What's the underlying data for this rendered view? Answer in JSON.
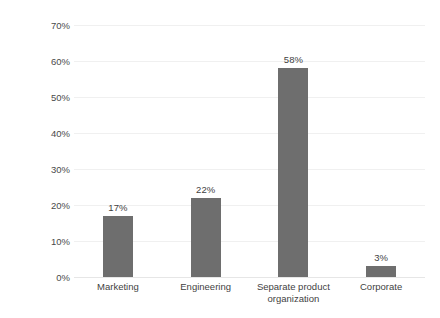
{
  "chart_data": {
    "type": "bar",
    "title": "",
    "subtitle": "",
    "xlabel": "",
    "ylabel": "Percentage",
    "categories": [
      "Marketing",
      "Engineering",
      "Separate product organization",
      "Corporate"
    ],
    "category_label_lines": [
      [
        "Marketing"
      ],
      [
        "Engineering"
      ],
      [
        "Separate product",
        "organization"
      ],
      [
        "Corporate"
      ]
    ],
    "values": [
      17,
      22,
      58,
      3
    ],
    "value_labels": [
      "17%",
      "22%",
      "58%",
      "3%"
    ],
    "ylim": [
      0,
      70
    ],
    "ytick_values": [
      0,
      10,
      20,
      30,
      40,
      50,
      60,
      70
    ],
    "ytick_labels": [
      "0%",
      "10%",
      "20%",
      "30%",
      "40%",
      "50%",
      "60%",
      "70%"
    ],
    "grid": true,
    "grid_axis": "y",
    "legend": false,
    "legend_position": "none",
    "series": [
      {
        "name": "Percentage",
        "values": [
          17,
          22,
          58,
          3
        ]
      }
    ]
  },
  "style": {
    "bar_color": "#6e6e6e",
    "gridline_color": "#f0f0f0",
    "baseline_color": "#e6e6e6",
    "text_color": "#3f3f3f",
    "tick_text_color": "#4a4a4a",
    "background_color": "#ffffff"
  }
}
